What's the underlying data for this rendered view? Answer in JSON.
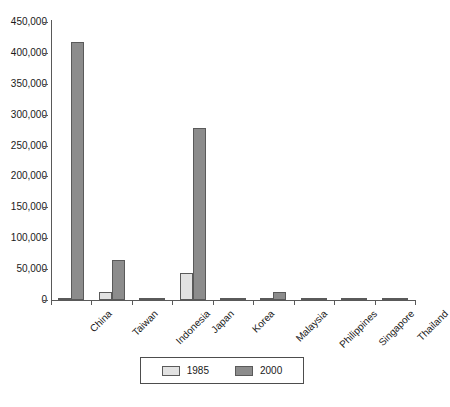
{
  "chart_data": {
    "type": "bar",
    "title": "",
    "subtitle": "",
    "xlabel": "",
    "ylabel": "",
    "ylim": [
      0,
      450000
    ],
    "grid": false,
    "legend_position": "bottom-center",
    "ytick_labels": [
      "450,000",
      "400,000",
      "350,000",
      "300,000",
      "250,000",
      "200,000",
      "150,000",
      "100,000",
      "50,000",
      "0"
    ],
    "ytick_values": [
      450000,
      400000,
      350000,
      300000,
      250000,
      200000,
      150000,
      100000,
      50000,
      0
    ],
    "categories": [
      "China",
      "Taiwan",
      "Indonesia",
      "Japan",
      "Korea",
      "Malaysia",
      "Philippines",
      "Singapore",
      "Thailand"
    ],
    "series": [
      {
        "name": "1985",
        "color": "#e2e2e2",
        "values": [
          3000,
          13000,
          1000,
          44000,
          1000,
          2500,
          1500,
          2000,
          2000
        ]
      },
      {
        "name": "2000",
        "color": "#8c8c8c",
        "values": [
          417000,
          65000,
          3000,
          278000,
          4000,
          13000,
          3500,
          3000,
          2500
        ]
      }
    ]
  },
  "legend": {
    "entries": [
      {
        "label": "1985",
        "swatch": "light-gray-swatch"
      },
      {
        "label": "2000",
        "swatch": "dark-gray-swatch"
      }
    ]
  },
  "colors": {
    "series_1985": "#e2e2e2",
    "series_2000": "#8c8c8c",
    "axis": "#595959",
    "text": "#1a1a1a",
    "background": "#ffffff"
  }
}
